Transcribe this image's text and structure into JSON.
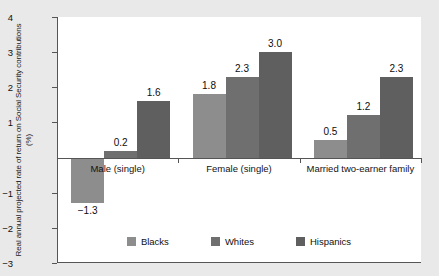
{
  "chart_data": {
    "type": "bar",
    "title": "",
    "xlabel": "",
    "ylabel": "Real annual projected rate of return on Social Security contributions (%)",
    "categories": [
      "Male (single)",
      "Female (single)",
      "Married two-earner family"
    ],
    "series": [
      {
        "name": "Blacks",
        "color": "#8d8d8d",
        "values": [
          -1.3,
          1.8,
          0.5
        ]
      },
      {
        "name": "Whites",
        "color": "#6f6f6f",
        "values": [
          0.2,
          2.3,
          1.2
        ]
      },
      {
        "name": "Hispanics",
        "color": "#5f5f5f",
        "values": [
          1.6,
          3.0,
          2.3
        ]
      }
    ],
    "value_labels": [
      [
        "-1.3",
        "0.2",
        "1.6"
      ],
      [
        "1.8",
        "2.3",
        "3.0"
      ],
      [
        "0.5",
        "1.2",
        "2.3"
      ]
    ],
    "ylim": [
      -3,
      4
    ],
    "yticks": [
      4,
      3,
      2,
      1,
      -1,
      -2,
      -3
    ],
    "ytick_labels": [
      "4",
      "3",
      "2",
      "1",
      "-1",
      "-2",
      "-3"
    ],
    "zero_line": 0,
    "grid": false,
    "legend_position": "bottom-center",
    "legend": [
      "Blacks",
      "Whites",
      "Hispanics"
    ],
    "plot_background": "#ffffff",
    "figure_background": "#e9e9e9",
    "axis_color": "#555555"
  }
}
